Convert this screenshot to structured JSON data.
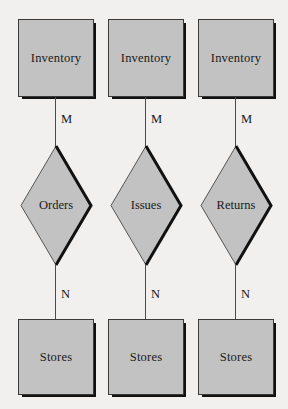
{
  "diagram": {
    "type": "er-diagram",
    "background_color": "#f1f0ee",
    "shape_fill_color": "#c2c2c2",
    "shape_border_color": "#3a3a3a",
    "shadow_color": "#111111"
  },
  "relationships": [
    {
      "entity_top": "Inventory",
      "cardinality_top": "M",
      "relationship": "Orders",
      "cardinality_bottom": "N",
      "entity_bottom": "Stores"
    },
    {
      "entity_top": "Inventory",
      "cardinality_top": "M",
      "relationship": "Issues",
      "cardinality_bottom": "N",
      "entity_bottom": "Stores"
    },
    {
      "entity_top": "Inventory",
      "cardinality_top": "M",
      "relationship": "Returns",
      "cardinality_bottom": "N",
      "entity_bottom": "Stores"
    }
  ]
}
